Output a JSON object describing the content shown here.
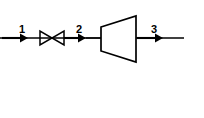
{
  "diagram": {
    "type": "process-flow-schematic",
    "background_color": "#ffffff",
    "line_color": "#000000",
    "canvas": {
      "width": 204,
      "height": 118
    },
    "flow_line": {
      "name": "working-fluid-line",
      "y": 38,
      "x_start": 0,
      "x_end": 184,
      "stroke_width": 1.4
    },
    "state_points": [
      {
        "id": "1",
        "label": "1",
        "label_x": 19,
        "label_y": 24,
        "arrow": {
          "x_start": 2,
          "x_end": 27,
          "y": 38,
          "direction": "right"
        },
        "description": "valve inlet"
      },
      {
        "id": "2",
        "label": "2",
        "label_x": 76,
        "label_y": 24,
        "arrow": {
          "x_start": 62,
          "x_end": 86,
          "y": 38,
          "direction": "right"
        },
        "description": "valve exit / turbine inlet"
      },
      {
        "id": "3",
        "label": "3",
        "label_x": 151,
        "label_y": 24,
        "arrow": {
          "x_start": 137,
          "x_end": 163,
          "y": 38,
          "direction": "right"
        },
        "description": "turbine exit"
      }
    ],
    "components": [
      {
        "name": "throttling-valve",
        "symbol": "bowtie",
        "x_left": 40,
        "x_right": 64,
        "y_center": 38,
        "half_height": 7
      },
      {
        "name": "turbine",
        "symbol": "trapezoid",
        "x_left": 101,
        "x_right": 136,
        "left_top_y": 27,
        "left_bottom_y": 51,
        "right_top_y": 16,
        "right_bottom_y": 62
      }
    ]
  }
}
